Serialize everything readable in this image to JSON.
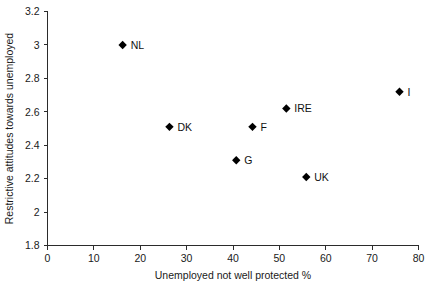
{
  "chart_data": {
    "type": "scatter",
    "title": "",
    "xlabel": "Unemployed not well protected %",
    "ylabel": "Restrictive attitudes towards unemployed",
    "xlim": [
      0,
      80
    ],
    "ylim": [
      1.8,
      3.2
    ],
    "xticks": [
      0,
      10,
      20,
      30,
      40,
      50,
      60,
      70,
      80
    ],
    "xtick_labels": [
      "0",
      "10",
      "20",
      "30",
      "40",
      "50",
      "60",
      "70",
      "80"
    ],
    "yticks": [
      1.8,
      2.0,
      2.2,
      2.4,
      2.6,
      2.8,
      3.0,
      3.2
    ],
    "ytick_labels": [
      "1.8",
      "2",
      "2.2",
      "2.4",
      "2.6",
      "2.8",
      "3",
      "3.2"
    ],
    "grid": false,
    "legend": "none",
    "marker": "diamond",
    "marker_color": "#000000",
    "points": [
      {
        "label": "NL",
        "x": 16.2,
        "y": 3.0,
        "label_dx": 8,
        "label_dy": 4
      },
      {
        "label": "DK",
        "x": 26.3,
        "y": 2.51,
        "label_dx": 8,
        "label_dy": 4
      },
      {
        "label": "G",
        "x": 40.7,
        "y": 2.31,
        "label_dx": 8,
        "label_dy": 4
      },
      {
        "label": "F",
        "x": 44.2,
        "y": 2.51,
        "label_dx": 8,
        "label_dy": 4
      },
      {
        "label": "IRE",
        "x": 51.5,
        "y": 2.62,
        "label_dx": 8,
        "label_dy": 4
      },
      {
        "label": "UK",
        "x": 55.8,
        "y": 2.21,
        "label_dx": 8,
        "label_dy": 4
      },
      {
        "label": "I",
        "x": 75.9,
        "y": 2.72,
        "label_dx": 8,
        "label_dy": 4
      }
    ]
  }
}
